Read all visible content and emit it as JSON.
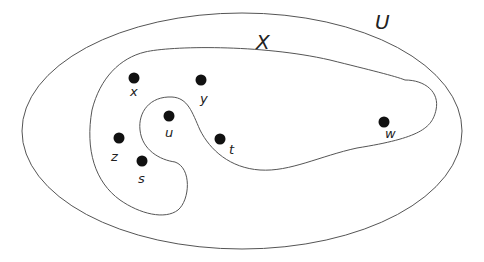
{
  "diagram": {
    "type": "venn-set-diagram",
    "sets": [
      {
        "id": "U",
        "label": "U",
        "description": "universal set (outer ellipse)"
      },
      {
        "id": "X",
        "label": "X",
        "description": "subset region (inner curved shape)"
      }
    ],
    "points": [
      {
        "id": "x",
        "label": "x",
        "cx": 134,
        "cy": 78,
        "lx": 131,
        "ly": 96,
        "in_X": true
      },
      {
        "id": "y",
        "label": "y",
        "cx": 201,
        "cy": 80,
        "lx": 201,
        "ly": 102,
        "in_X": true
      },
      {
        "id": "u",
        "label": "u",
        "cx": 169,
        "cy": 116,
        "lx": 166,
        "ly": 137,
        "in_X": false
      },
      {
        "id": "z",
        "label": "z",
        "cx": 119,
        "cy": 138,
        "lx": 111,
        "ly": 160,
        "in_X": true
      },
      {
        "id": "s",
        "label": "s",
        "cx": 142,
        "cy": 161,
        "lx": 139,
        "ly": 182,
        "in_X": true
      },
      {
        "id": "t",
        "label": "t",
        "cx": 220,
        "cy": 139,
        "lx": 230,
        "ly": 153,
        "in_X": true
      },
      {
        "id": "w",
        "label": "w",
        "cx": 384,
        "cy": 122,
        "lx": 386,
        "ly": 137,
        "in_X": true
      }
    ],
    "colors": {
      "stroke": "#555555",
      "dot": "#111111",
      "text": "#222222",
      "background": "#ffffff"
    }
  }
}
